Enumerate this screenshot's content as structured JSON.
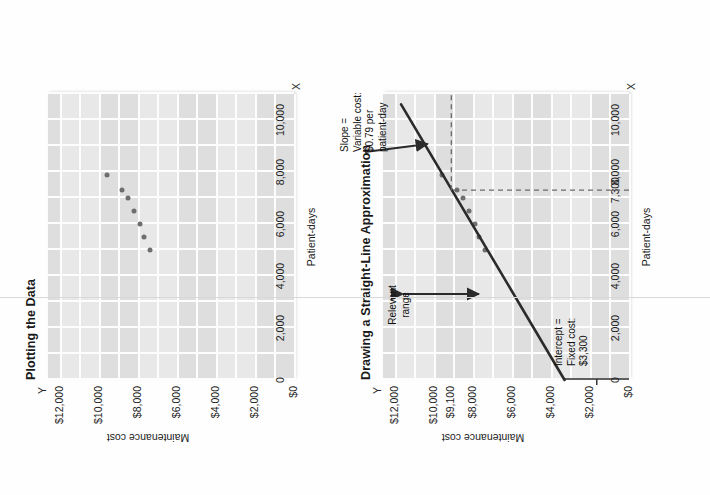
{
  "figures": [
    {
      "id": "plotting-the-data",
      "title": "Plotting the Data",
      "axis_letters": {
        "y": "Y",
        "x": "X"
      },
      "y_axis_title": "Maintenance cost",
      "x_axis_title": "Patient-days",
      "y_ticks": [
        "$0",
        "$2,000",
        "$4,000",
        "$6,000",
        "$8,000",
        "$10,000",
        "$12,000"
      ],
      "x_ticks": [
        "0",
        "2,000",
        "4,000",
        "6,000",
        "8,000",
        "10,000"
      ]
    },
    {
      "id": "straight-line-approximation",
      "title": "Drawing a Straight-Line Approximation",
      "axis_letters": {
        "y": "Y",
        "x": "X"
      },
      "y_axis_title": "Maintenance cost",
      "x_axis_title": "Patient-days",
      "y_ticks": [
        "$0",
        "$2,000",
        "$4,000",
        "$6,000",
        "$8,000",
        "$9,100",
        "$10,000",
        "$12,000"
      ],
      "x_ticks": [
        "0",
        "2,000",
        "4,000",
        "6,000",
        "7,300",
        "8,000",
        "10,000"
      ],
      "annotations": {
        "slope": "Slope =\nVariable cost:\n$0.79 per\npatient-day",
        "relevant_range": "Relevant\nrange",
        "intercept": "Intercept =\nFixed cost:\n$3,300"
      }
    }
  ],
  "chart_data": [
    {
      "type": "scatter",
      "title": "Plotting the Data",
      "xlabel": "Patient-days",
      "ylabel": "Maintenance cost",
      "xlim": [
        0,
        11000
      ],
      "ylim": [
        0,
        12600
      ],
      "grid": true,
      "x_ticks": [
        0,
        2000,
        4000,
        6000,
        8000,
        10000
      ],
      "x_tick_labels": [
        "0",
        "2,000",
        "4,000",
        "6,000",
        "8,000",
        "10,000"
      ],
      "y_ticks": [
        0,
        2000,
        4000,
        6000,
        8000,
        10000,
        12000
      ],
      "y_tick_labels": [
        "$0",
        "$2,000",
        "$4,000",
        "$6,000",
        "$8,000",
        "$10,000",
        "$12,000"
      ],
      "points": [
        {
          "x": 5000,
          "y": 7400
        },
        {
          "x": 5500,
          "y": 7700
        },
        {
          "x": 6000,
          "y": 7900
        },
        {
          "x": 6500,
          "y": 8200
        },
        {
          "x": 7000,
          "y": 8500
        },
        {
          "x": 7300,
          "y": 8800
        },
        {
          "x": 7900,
          "y": 9600
        }
      ]
    },
    {
      "type": "scatter",
      "title": "Drawing a Straight-Line Approximation",
      "xlabel": "Patient-days",
      "ylabel": "Maintenance cost",
      "xlim": [
        0,
        11000
      ],
      "ylim": [
        0,
        12600
      ],
      "grid": true,
      "x_ticks": [
        0,
        2000,
        4000,
        6000,
        7300,
        8000,
        10000
      ],
      "x_tick_labels": [
        "0",
        "2,000",
        "4,000",
        "6,000",
        "7,300",
        "8,000",
        "10,000"
      ],
      "y_ticks": [
        0,
        2000,
        4000,
        6000,
        8000,
        9100,
        10000,
        12000
      ],
      "y_tick_labels": [
        "$0",
        "$2,000",
        "$4,000",
        "$6,000",
        "$8,000",
        "$9,100",
        "$10,000",
        "$12,000"
      ],
      "points": [
        {
          "x": 5000,
          "y": 7400
        },
        {
          "x": 5500,
          "y": 7700
        },
        {
          "x": 6000,
          "y": 7900
        },
        {
          "x": 6500,
          "y": 8200
        },
        {
          "x": 7000,
          "y": 8500
        },
        {
          "x": 7300,
          "y": 8800
        },
        {
          "x": 7900,
          "y": 9600
        }
      ],
      "fit_line": {
        "intercept": 3300,
        "slope": 0.79,
        "x_from": 0,
        "x_to": 10600,
        "label": "straight-line approximation"
      },
      "reference_lines": [
        {
          "orientation": "vertical",
          "x": 7300,
          "style": "dashed",
          "label": "7,300"
        },
        {
          "orientation": "horizontal",
          "y": 9100,
          "style": "dashed",
          "label": "$9,100"
        }
      ],
      "annotations": [
        {
          "text": "Slope =\nVariable cost:\n$0.79 per\npatient-day",
          "points_to": "fit-line"
        },
        {
          "text": "Relevant\nrange",
          "type": "double-arrow-span"
        },
        {
          "text": "Intercept =\nFixed cost:\n$3,300",
          "points_to": "y-intercept"
        }
      ]
    }
  ],
  "colors": {
    "plot_background": "#dedede",
    "plot_band": "#e8e8e8",
    "gridline": "#fdfdfd",
    "data_point": "#6e6e6e",
    "fit_line": "#2b2b2b",
    "dashed_reference": "#6a6a6a",
    "text": "#1a1a1a",
    "page_background": "#fefefe"
  }
}
